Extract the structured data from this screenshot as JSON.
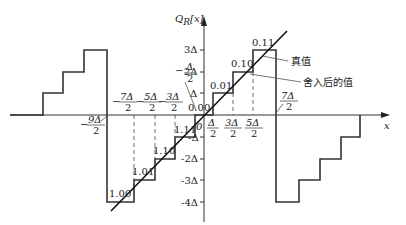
{
  "diagram": {
    "type": "quantization-transfer-function",
    "y_axis_label": "Q_R[x]",
    "x_axis_label": "x",
    "y_ticks": [
      "3Δ",
      "2Δ",
      "Δ",
      "-Δ",
      "-2Δ",
      "-3Δ",
      "-4Δ"
    ],
    "x_ticks_positive": [
      "Δ/2",
      "3Δ/2",
      "5Δ/2",
      "7Δ/2"
    ],
    "x_ticks_negative": [
      "-Δ/2",
      "-3Δ/2",
      "-5Δ/2",
      "-7Δ/2",
      "-9Δ/2"
    ],
    "code_labels": {
      "c000": "0.00",
      "c001": "0.01",
      "c010": "0.10",
      "c011": "0.11",
      "c100": "1.00",
      "c101": "1.01",
      "c110": "1.10",
      "c111": "1.11",
      "zero": "0"
    },
    "annotations": {
      "true_value": "真值",
      "rounded_value": "舍入后的值"
    },
    "tick_text": {
      "t3": "3Δ",
      "t2": "2Δ",
      "t1": "Δ",
      "tm1": "-Δ",
      "tm2": "-2Δ",
      "tm3": "-3Δ",
      "tm4": "-4Δ",
      "num_half": "Δ",
      "num_3": "3Δ",
      "num_5": "5Δ",
      "num_7": "7Δ",
      "num_m1": "Δ",
      "num_m3": "3Δ",
      "num_m5": "5Δ",
      "num_m7": "7Δ",
      "num_m9": "9Δ",
      "den": "2",
      "minus": "−",
      "yl_main": "Q",
      "yl_sub": "R",
      "yl_arg": "[x]",
      "xl": "x"
    }
  }
}
